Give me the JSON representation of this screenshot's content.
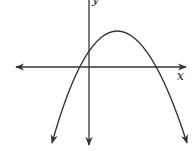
{
  "diagram": {
    "type": "coordinate-plane-graph",
    "axes": {
      "x_label": "x",
      "y_label": "y"
    },
    "curve": {
      "shape": "parabola",
      "opens": "down",
      "vertex_quadrant": "I",
      "y_intercept_sign": "positive",
      "x_intercepts": [
        "negative",
        "positive"
      ]
    },
    "colors": {
      "stroke": "#333333",
      "background": "#ffffff"
    }
  }
}
